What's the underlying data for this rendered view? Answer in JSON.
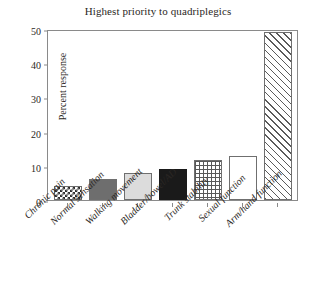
{
  "chart_data": {
    "type": "bar",
    "title": "Highest priority to quadriplegics",
    "xlabel": "",
    "ylabel": "Percent response",
    "ylim": [
      0,
      50
    ],
    "yticks": [
      "0",
      "10",
      "20",
      "30",
      "40",
      "50"
    ],
    "grid": false,
    "legend": "none",
    "categories": [
      "Chronic pain",
      "Normal sensation",
      "Walking movement",
      "Bladder/bowel/AD",
      "Trunk stability",
      "Sexual function",
      "Arm/hand function"
    ],
    "values": [
      4,
      6,
      8,
      9,
      11.7,
      13,
      49
    ],
    "bar_patterns": [
      "checkerboard",
      "dark-gray-solid",
      "light-gray-solid",
      "black-solid",
      "cross-hatch-grid",
      "white-empty",
      "diagonal-hatch"
    ]
  },
  "colors": {
    "axis": "#8a8a8a",
    "text": "#2b2724",
    "bar_dark_gray": "#6e6e6e",
    "bar_light_gray": "#dcdcdc",
    "bar_black": "#1a1a1a",
    "background": "#ffffff"
  }
}
